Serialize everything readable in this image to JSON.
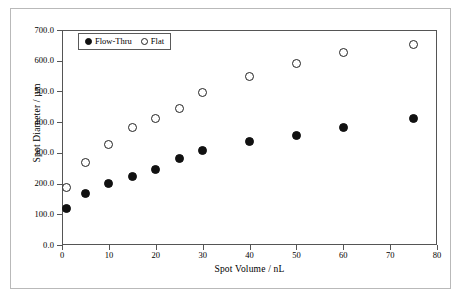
{
  "chart_data": {
    "type": "scatter",
    "title": "",
    "xlabel": "Spot Volume / nL",
    "ylabel": "Spot Diameter / µm",
    "xlim": [
      0,
      80
    ],
    "ylim": [
      0,
      700
    ],
    "xticks": [
      "0",
      "10",
      "20",
      "30",
      "40",
      "50",
      "60",
      "70",
      "80"
    ],
    "xtick_values": [
      0,
      10,
      20,
      30,
      40,
      50,
      60,
      70,
      80
    ],
    "yticks": [
      "0.0",
      "100.0",
      "200.0",
      "300.0",
      "400.0",
      "500.0",
      "600.0",
      "700.0"
    ],
    "ytick_values": [
      0,
      100,
      200,
      300,
      400,
      500,
      600,
      700
    ],
    "grid": false,
    "legend_position": "upper-left-inside",
    "series": [
      {
        "name": "Flow-Thru",
        "marker": "filled-circle",
        "color": "#111111",
        "x": [
          1,
          5,
          10,
          15,
          20,
          25,
          30,
          40,
          50,
          60,
          75
        ],
        "y": [
          118,
          168,
          199,
          223,
          246,
          281,
          307,
          336,
          358,
          382,
          413
        ]
      },
      {
        "name": "Flat",
        "marker": "open-circle",
        "color": "#222222",
        "x": [
          1,
          5,
          10,
          15,
          20,
          25,
          30,
          40,
          50,
          60,
          75
        ],
        "y": [
          187,
          269,
          326,
          383,
          412,
          445,
          495,
          548,
          592,
          626,
          653
        ]
      }
    ]
  },
  "legend": {
    "entries": [
      {
        "label": "Flow-Thru",
        "marker": "filled-circle"
      },
      {
        "label": "Flat",
        "marker": "open-circle"
      }
    ]
  }
}
